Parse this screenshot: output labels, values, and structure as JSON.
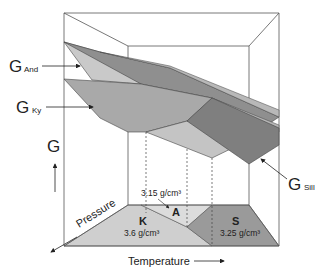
{
  "labels": {
    "g_and": {
      "main": "G",
      "sub": "And"
    },
    "g_ky": {
      "main": "G",
      "sub": "Ky"
    },
    "g_sill": {
      "main": "G",
      "sub": "Sill"
    },
    "g_axis": "G",
    "pressure": "Pressure",
    "temperature": "Temperature"
  },
  "fields": {
    "kyanite": {
      "letter": "K",
      "density": "3.6 g/cm³"
    },
    "andalusite": {
      "letter": "A",
      "density": "3.15 g/cm³"
    },
    "sillimanite": {
      "letter": "S",
      "density": "3.25 g/cm³"
    }
  },
  "colors": {
    "andalusite_surface": "#c9c9c9",
    "kyanite_surface": "#a9a9a9",
    "sillimanite_surface": "#8a8a8a",
    "floor_k": "#cfcfcf",
    "floor_a": "#dcdcdc",
    "floor_s": "#9a9a9a",
    "edge": "#444444"
  }
}
